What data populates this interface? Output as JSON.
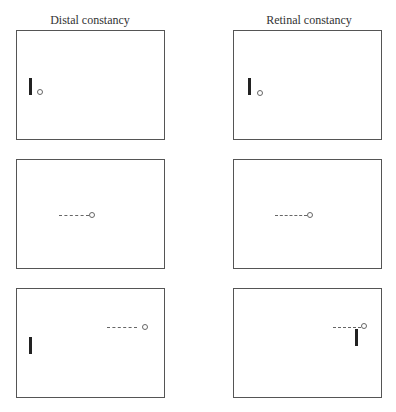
{
  "columns": [
    {
      "title": "Distal constancy"
    },
    {
      "title": "Retinal constancy"
    }
  ],
  "panels": [
    {
      "column": "Distal constancy",
      "row": 1,
      "bar": "left-middle",
      "ball": "adjacent to bar",
      "trail": false
    },
    {
      "column": "Retinal constancy",
      "row": 1,
      "bar": "left-middle",
      "ball": "adjacent to bar",
      "trail": false
    },
    {
      "column": "Distal constancy",
      "row": 2,
      "bar": "none",
      "ball": "center",
      "trail": true
    },
    {
      "column": "Retinal constancy",
      "row": 2,
      "bar": "none",
      "ball": "center",
      "trail": true
    },
    {
      "column": "Distal constancy",
      "row": 3,
      "bar": "left-bottom",
      "ball": "right",
      "trail": true
    },
    {
      "column": "Retinal constancy",
      "row": 3,
      "bar": "below ball, right",
      "ball": "right",
      "trail": true
    }
  ]
}
